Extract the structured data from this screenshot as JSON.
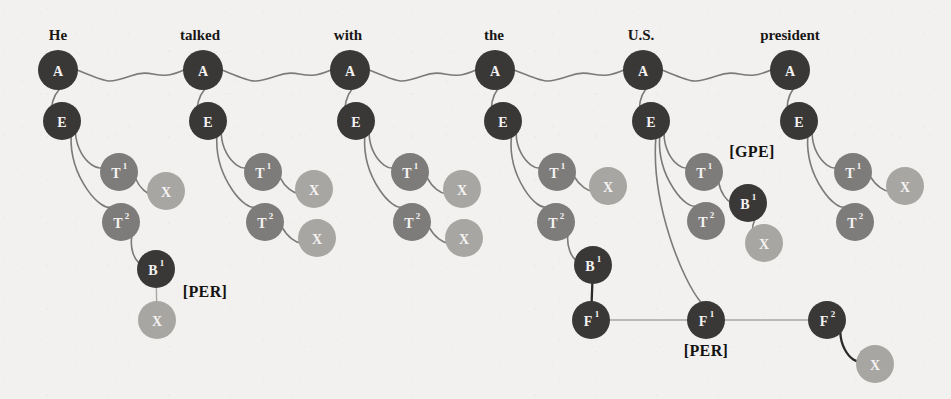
{
  "figure": {
    "title": "",
    "background_color": "#f2f1ef",
    "colors": {
      "node_dark": "#3a3837",
      "node_mid": "#7e7c7a",
      "node_light": "#a8a6a3",
      "edge": "#7c7a78",
      "edge_faint": "#a9a7a4",
      "edge_dark": "#2b2a29",
      "node_text": "#f4f3f1",
      "label_text": "#181716"
    }
  },
  "sentence": {
    "words": [
      {
        "text": "He",
        "x": 58
      },
      {
        "text": "talked",
        "x": 200
      },
      {
        "text": "with",
        "x": 348
      },
      {
        "text": "the",
        "x": 494
      },
      {
        "text": "U.S.",
        "x": 641
      },
      {
        "text": "president",
        "x": 790
      }
    ]
  },
  "tags": [
    {
      "text": "[PER]",
      "x": 205,
      "y": 297
    },
    {
      "text": "[GPE]",
      "x": 752,
      "y": 157
    },
    {
      "text": "[PER]",
      "x": 706,
      "y": 356
    }
  ],
  "nodes": [
    {
      "id": "a1",
      "label": "A",
      "sup": "",
      "x": 58,
      "y": 70,
      "r": 20,
      "tone": "dark"
    },
    {
      "id": "a2",
      "label": "A",
      "sup": "",
      "x": 203,
      "y": 70,
      "r": 20,
      "tone": "dark"
    },
    {
      "id": "a3",
      "label": "A",
      "sup": "",
      "x": 350,
      "y": 70,
      "r": 20,
      "tone": "dark"
    },
    {
      "id": "a4",
      "label": "A",
      "sup": "",
      "x": 495,
      "y": 70,
      "r": 20,
      "tone": "dark"
    },
    {
      "id": "a5",
      "label": "A",
      "sup": "",
      "x": 643,
      "y": 70,
      "r": 20,
      "tone": "dark"
    },
    {
      "id": "a6",
      "label": "A",
      "sup": "",
      "x": 790,
      "y": 70,
      "r": 20,
      "tone": "dark"
    },
    {
      "id": "e1",
      "label": "E",
      "sup": "",
      "x": 62,
      "y": 121,
      "r": 19,
      "tone": "dark"
    },
    {
      "id": "e2",
      "label": "E",
      "sup": "",
      "x": 208,
      "y": 121,
      "r": 19,
      "tone": "dark"
    },
    {
      "id": "e3",
      "label": "E",
      "sup": "",
      "x": 356,
      "y": 121,
      "r": 19,
      "tone": "dark"
    },
    {
      "id": "e4",
      "label": "E",
      "sup": "",
      "x": 503,
      "y": 121,
      "r": 19,
      "tone": "dark"
    },
    {
      "id": "e5",
      "label": "E",
      "sup": "",
      "x": 651,
      "y": 121,
      "r": 19,
      "tone": "dark"
    },
    {
      "id": "e6",
      "label": "E",
      "sup": "",
      "x": 799,
      "y": 121,
      "r": 19,
      "tone": "dark"
    },
    {
      "id": "t1a",
      "label": "T",
      "sup": "1",
      "x": 119,
      "y": 172,
      "r": 19,
      "tone": "mid"
    },
    {
      "id": "x1a",
      "label": "X",
      "sup": "",
      "x": 166,
      "y": 191,
      "r": 19,
      "tone": "light"
    },
    {
      "id": "t1b",
      "label": "T",
      "sup": "2",
      "x": 121,
      "y": 222,
      "r": 19,
      "tone": "mid"
    },
    {
      "id": "b1",
      "label": "B",
      "sup": "1",
      "x": 156,
      "y": 269,
      "r": 19,
      "tone": "dark"
    },
    {
      "id": "x1b",
      "label": "X",
      "sup": "",
      "x": 157,
      "y": 320,
      "r": 19,
      "tone": "light"
    },
    {
      "id": "t2a",
      "label": "T",
      "sup": "1",
      "x": 263,
      "y": 172,
      "r": 19,
      "tone": "mid"
    },
    {
      "id": "x2a",
      "label": "X",
      "sup": "",
      "x": 314,
      "y": 189,
      "r": 19,
      "tone": "light"
    },
    {
      "id": "t2b",
      "label": "T",
      "sup": "2",
      "x": 265,
      "y": 222,
      "r": 19,
      "tone": "mid"
    },
    {
      "id": "x2b",
      "label": "X",
      "sup": "",
      "x": 317,
      "y": 238,
      "r": 19,
      "tone": "light"
    },
    {
      "id": "t3a",
      "label": "T",
      "sup": "1",
      "x": 410,
      "y": 172,
      "r": 19,
      "tone": "mid"
    },
    {
      "id": "x3a",
      "label": "X",
      "sup": "",
      "x": 462,
      "y": 189,
      "r": 19,
      "tone": "light"
    },
    {
      "id": "t3b",
      "label": "T",
      "sup": "2",
      "x": 412,
      "y": 222,
      "r": 19,
      "tone": "mid"
    },
    {
      "id": "x3b",
      "label": "X",
      "sup": "",
      "x": 464,
      "y": 238,
      "r": 19,
      "tone": "light"
    },
    {
      "id": "t4a",
      "label": "T",
      "sup": "1",
      "x": 557,
      "y": 172,
      "r": 19,
      "tone": "mid"
    },
    {
      "id": "x4a",
      "label": "X",
      "sup": "",
      "x": 608,
      "y": 186,
      "r": 19,
      "tone": "light"
    },
    {
      "id": "t4b",
      "label": "T",
      "sup": "2",
      "x": 556,
      "y": 222,
      "r": 19,
      "tone": "mid"
    },
    {
      "id": "b4",
      "label": "B",
      "sup": "1",
      "x": 593,
      "y": 265,
      "r": 19,
      "tone": "dark"
    },
    {
      "id": "f4",
      "label": "F",
      "sup": "1",
      "x": 591,
      "y": 320,
      "r": 19,
      "tone": "dark"
    },
    {
      "id": "t5a",
      "label": "T",
      "sup": "1",
      "x": 704,
      "y": 172,
      "r": 19,
      "tone": "mid"
    },
    {
      "id": "b5",
      "label": "B",
      "sup": "1",
      "x": 748,
      "y": 203,
      "r": 19,
      "tone": "dark"
    },
    {
      "id": "x5b",
      "label": "X",
      "sup": "",
      "x": 764,
      "y": 243,
      "r": 19,
      "tone": "light"
    },
    {
      "id": "t5b",
      "label": "T",
      "sup": "2",
      "x": 706,
      "y": 221,
      "r": 19,
      "tone": "mid"
    },
    {
      "id": "f5",
      "label": "F",
      "sup": "1",
      "x": 706,
      "y": 320,
      "r": 19,
      "tone": "dark"
    },
    {
      "id": "t6a",
      "label": "T",
      "sup": "1",
      "x": 853,
      "y": 172,
      "r": 19,
      "tone": "mid"
    },
    {
      "id": "x6a",
      "label": "X",
      "sup": "",
      "x": 905,
      "y": 186,
      "r": 19,
      "tone": "light"
    },
    {
      "id": "t6b",
      "label": "T",
      "sup": "2",
      "x": 855,
      "y": 222,
      "r": 19,
      "tone": "mid"
    },
    {
      "id": "f6",
      "label": "F",
      "sup": "2",
      "x": 827,
      "y": 320,
      "r": 19,
      "tone": "dark"
    },
    {
      "id": "x6b",
      "label": "X",
      "sup": "",
      "x": 875,
      "y": 364,
      "r": 19,
      "tone": "light"
    }
  ],
  "edges": [
    {
      "from": "a1",
      "to": "a2",
      "style": "wavy",
      "tone": "edge"
    },
    {
      "from": "a2",
      "to": "a3",
      "style": "wavy",
      "tone": "edge"
    },
    {
      "from": "a3",
      "to": "a4",
      "style": "wavy",
      "tone": "edge"
    },
    {
      "from": "a4",
      "to": "a5",
      "style": "wavy",
      "tone": "edge"
    },
    {
      "from": "a5",
      "to": "a6",
      "style": "wavy",
      "tone": "edge"
    },
    {
      "from": "a1",
      "to": "e1",
      "style": "curve",
      "tone": "edge"
    },
    {
      "from": "a2",
      "to": "e2",
      "style": "curve",
      "tone": "edge"
    },
    {
      "from": "a3",
      "to": "e3",
      "style": "curve",
      "tone": "edge"
    },
    {
      "from": "a4",
      "to": "e4",
      "style": "curve",
      "tone": "edge"
    },
    {
      "from": "a5",
      "to": "e5",
      "style": "curve",
      "tone": "edge"
    },
    {
      "from": "a6",
      "to": "e6",
      "style": "curve",
      "tone": "edge"
    },
    {
      "from": "e1",
      "to": "t1a",
      "style": "curve",
      "tone": "edge"
    },
    {
      "from": "t1a",
      "to": "x1a",
      "style": "curve",
      "tone": "edge"
    },
    {
      "from": "e1",
      "to": "t1b",
      "style": "curve",
      "tone": "edge"
    },
    {
      "from": "t1b",
      "to": "b1",
      "style": "curve",
      "tone": "edge"
    },
    {
      "from": "b1",
      "to": "x1b",
      "style": "line",
      "tone": "faint"
    },
    {
      "from": "e2",
      "to": "t2a",
      "style": "curve",
      "tone": "edge"
    },
    {
      "from": "t2a",
      "to": "x2a",
      "style": "curve",
      "tone": "edge"
    },
    {
      "from": "e2",
      "to": "t2b",
      "style": "curve",
      "tone": "edge"
    },
    {
      "from": "t2b",
      "to": "x2b",
      "style": "curve",
      "tone": "edge"
    },
    {
      "from": "e3",
      "to": "t3a",
      "style": "curve",
      "tone": "edge"
    },
    {
      "from": "t3a",
      "to": "x3a",
      "style": "curve",
      "tone": "edge"
    },
    {
      "from": "e3",
      "to": "t3b",
      "style": "curve",
      "tone": "edge"
    },
    {
      "from": "t3b",
      "to": "x3b",
      "style": "curve",
      "tone": "edge"
    },
    {
      "from": "e4",
      "to": "t4a",
      "style": "curve",
      "tone": "edge"
    },
    {
      "from": "t4a",
      "to": "x4a",
      "style": "curve",
      "tone": "edge"
    },
    {
      "from": "e4",
      "to": "t4b",
      "style": "curve",
      "tone": "edge"
    },
    {
      "from": "t4b",
      "to": "b4",
      "style": "curve",
      "tone": "edge"
    },
    {
      "from": "b4",
      "to": "f4",
      "style": "line",
      "tone": "dark"
    },
    {
      "from": "e5",
      "to": "t5a",
      "style": "curve",
      "tone": "edge"
    },
    {
      "from": "t5a",
      "to": "b5",
      "style": "curve",
      "tone": "edge"
    },
    {
      "from": "b5",
      "to": "x5b",
      "style": "curve",
      "tone": "edge"
    },
    {
      "from": "e5",
      "to": "t5b",
      "style": "curve",
      "tone": "edge"
    },
    {
      "from": "e5",
      "to": "f5",
      "style": "curve",
      "tone": "edge"
    },
    {
      "from": "e6",
      "to": "t6a",
      "style": "curve",
      "tone": "edge"
    },
    {
      "from": "t6a",
      "to": "x6a",
      "style": "curve",
      "tone": "edge"
    },
    {
      "from": "e6",
      "to": "t6b",
      "style": "curve",
      "tone": "edge"
    },
    {
      "from": "f6",
      "to": "x6b",
      "style": "curve",
      "tone": "dark"
    },
    {
      "from": "f4",
      "to": "f5",
      "style": "line",
      "tone": "faint"
    },
    {
      "from": "f5",
      "to": "f6",
      "style": "line",
      "tone": "faint"
    }
  ]
}
